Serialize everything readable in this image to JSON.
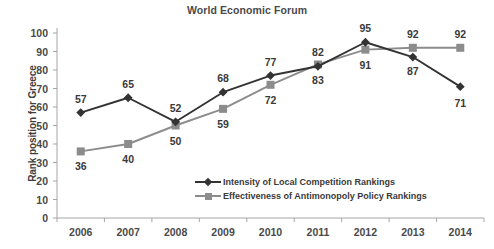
{
  "chart_data": {
    "type": "line",
    "title": "World Economic Forum",
    "xlabel": "",
    "ylabel": "Rank position for Greece",
    "categories": [
      "2006",
      "2007",
      "2008",
      "2009",
      "2010",
      "2011",
      "2012",
      "2013",
      "2014"
    ],
    "ylim": [
      0,
      100
    ],
    "yticks": [
      "0",
      "10",
      "20",
      "30",
      "40",
      "50",
      "60",
      "70",
      "80",
      "90",
      "100"
    ],
    "grid": false,
    "legend_position": "inside lower-center",
    "series": [
      {
        "name": "Intensity of Local Competition Rankings",
        "color": "#333333",
        "marker": "diamond",
        "values": [
          57,
          65,
          52,
          68,
          77,
          82,
          95,
          87,
          71
        ],
        "labels": [
          "57",
          "65",
          "52",
          "68",
          "77",
          "82",
          "95",
          "87",
          "71"
        ]
      },
      {
        "name": "Effectiveness of Antimonopoly Policy Rankings",
        "color": "#8c8c8c",
        "marker": "square",
        "values": [
          36,
          40,
          50,
          59,
          72,
          83,
          91,
          92,
          92
        ],
        "labels": [
          "36",
          "40",
          "50",
          "59",
          "72",
          "83",
          "91",
          "92",
          "92"
        ]
      }
    ]
  },
  "axis": {
    "line_color": "#a6a6a6",
    "tick_color": "#a6a6a6"
  }
}
